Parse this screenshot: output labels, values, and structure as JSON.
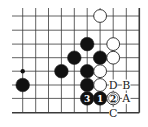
{
  "diagram": {
    "type": "go-board-fragment",
    "corner": "bottom-right",
    "grid": {
      "columns": 10,
      "rows": 8,
      "x": [
        22.7,
        35.7,
        48.5,
        61.4,
        74.3,
        87.2,
        100.1,
        113.2,
        126.3,
        139.3
      ],
      "y": [
        16,
        30.2,
        44.1,
        57.7,
        71.2,
        85,
        98.4,
        112.7
      ],
      "line_left": 12,
      "line_top": 8,
      "right_edge": true,
      "bottom_edge": true
    },
    "colors": {
      "line": "#3a3a3a",
      "black_stone": "#111111",
      "white_stone": "#ffffff",
      "stone_outline": "#222222",
      "label": "#222222"
    },
    "star_points": [
      {
        "col": 0,
        "row": 4
      }
    ],
    "stones": [
      {
        "col": 6,
        "row": 0,
        "color": "white",
        "label": ""
      },
      {
        "col": 5,
        "row": 2,
        "color": "black",
        "label": ""
      },
      {
        "col": 7,
        "row": 2,
        "color": "white",
        "label": ""
      },
      {
        "col": 4,
        "row": 3,
        "color": "black",
        "label": ""
      },
      {
        "col": 6,
        "row": 3,
        "color": "black",
        "label": ""
      },
      {
        "col": 7,
        "row": 3,
        "color": "white",
        "label": ""
      },
      {
        "col": 3,
        "row": 4,
        "color": "black",
        "label": ""
      },
      {
        "col": 5,
        "row": 4,
        "color": "black",
        "label": ""
      },
      {
        "col": 6,
        "row": 4,
        "color": "white",
        "label": ""
      },
      {
        "col": 0,
        "row": 5,
        "color": "black",
        "label": ""
      },
      {
        "col": 5,
        "row": 5,
        "color": "black",
        "label": ""
      },
      {
        "col": 6,
        "row": 5,
        "color": "white",
        "label": ""
      },
      {
        "col": 5,
        "row": 6,
        "color": "black",
        "label": "3"
      },
      {
        "col": 6,
        "row": 6,
        "color": "black",
        "label": "1"
      },
      {
        "col": 7,
        "row": 6,
        "color": "white",
        "label": "2"
      }
    ],
    "point_labels": [
      {
        "col": 7,
        "row": 5,
        "text": "D"
      },
      {
        "col": 8,
        "row": 5,
        "text": "B"
      },
      {
        "col": 8,
        "row": 6,
        "text": "A"
      },
      {
        "col": 7,
        "row": 7,
        "text": "C"
      }
    ]
  }
}
